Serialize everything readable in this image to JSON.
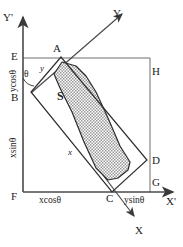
{
  "diagram": {
    "fill_color": "#c9c9c9",
    "line_color": "#3a3a3a",
    "axes": {
      "x_prime": "X'",
      "y_prime": "Y'",
      "x_rot": "X",
      "y_rot": "Y"
    },
    "points": {
      "A": "A",
      "B": "B",
      "C": "C",
      "D": "D",
      "E": "E",
      "F": "F",
      "G": "G",
      "H": "H"
    },
    "region_label": "S",
    "angle_label": "θ",
    "side_labels": {
      "y_short": "y",
      "x_long": "x"
    },
    "projections": {
      "ycos": "ycosθ",
      "xsin": "xsinθ",
      "xcos": "xcosθ",
      "ysin": "ysinθ"
    }
  }
}
